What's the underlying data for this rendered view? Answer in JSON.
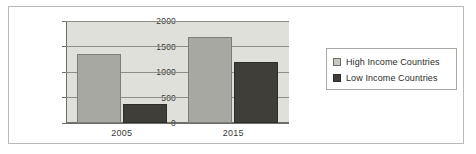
{
  "chart_data": {
    "type": "bar",
    "title": "",
    "xlabel": "",
    "ylabel": "",
    "categories": [
      "2005",
      "2015"
    ],
    "series": [
      {
        "name": "High Income Countries",
        "values": [
          1350,
          1680
        ],
        "color": "#a8a8a3"
      },
      {
        "name": "Low Income Countries",
        "values": [
          370,
          1200
        ],
        "color": "#3f3e39"
      }
    ],
    "ylim": [
      0,
      2000
    ],
    "yticks": [
      0,
      500,
      1000,
      1500,
      2000
    ],
    "ytick_labels": [
      "0",
      "500",
      "1000",
      "1500",
      "2000"
    ],
    "grid": true,
    "legend_position": "right"
  },
  "legend": {
    "entries": [
      {
        "label": "High Income Countries",
        "swatch": "light-gray-square"
      },
      {
        "label": "Low Income Countries",
        "swatch": "dark-gray-square"
      }
    ]
  },
  "colors": {
    "plot_background": "#dfe0da",
    "figure_background": "#ffffff",
    "axis": "#6f6f6a",
    "gridline": "#8c8d87",
    "series_high": "#a8a8a3",
    "series_low": "#3f3e39",
    "frame_border": "#b9bab4"
  }
}
